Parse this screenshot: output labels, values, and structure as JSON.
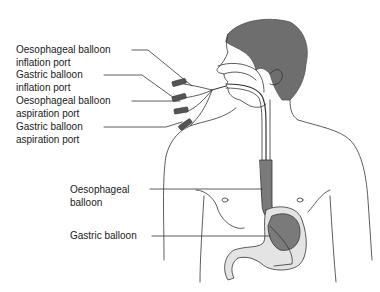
{
  "diagram": {
    "labels": [
      {
        "id": "oes-inflation",
        "line1": "Oesophageal balloon",
        "line2": "inflation port"
      },
      {
        "id": "gas-inflation",
        "line1": "Gastric balloon",
        "line2": "inflation port"
      },
      {
        "id": "oes-aspiration",
        "line1": "Oesophageal balloon",
        "line2": "aspiration port"
      },
      {
        "id": "gas-aspiration",
        "line1": "Gastric balloon",
        "line2": "aspiration port"
      },
      {
        "id": "oes-balloon",
        "line1": "Oesophageal",
        "line2": "balloon"
      },
      {
        "id": "gas-balloon",
        "line1": "Gastric balloon",
        "line2": ""
      }
    ],
    "colors": {
      "hair": "#6e6e6e",
      "line": "#333333",
      "balloon_fill": "#7a7a7a",
      "stomach_fill": "#e4e4e4",
      "background": "#ffffff"
    }
  }
}
